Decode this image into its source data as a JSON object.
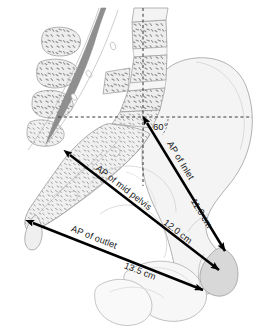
{
  "figure": {
    "type": "anatomical-diagram",
    "view": "midsagittal section",
    "background_color": "#ffffff"
  },
  "palette": {
    "bone_fill": "#f2f2f2",
    "bone_fill_light": "#f7f7f7",
    "bone_outline": "#9a9a9a",
    "trabecular_fill": "#e6e6e6",
    "stipple": "#8e8e8e",
    "spinal_canal": "#8c8c8c",
    "symphysis_fill": "#d6d6d6",
    "arrow_color": "#000000",
    "guide_color": "#3d3d3d",
    "text_color": "#1a1a1a"
  },
  "measurements": [
    {
      "id": "ap-inlet",
      "name_label": "AP of Inlet",
      "value_label": "11.0 cm",
      "value": 11.0,
      "unit": "cm",
      "from": "sacral promontory",
      "to": "superior border of pubic symphysis",
      "start": {
        "x": 145,
        "y": 121
      },
      "end": {
        "x": 227,
        "y": 253
      },
      "name_label_offset": 0.4,
      "value_label_offset": 0.78
    },
    {
      "id": "ap-mid-pelvis",
      "name_label": "AP of mid pelvis",
      "value_label": "12.0 cm",
      "value": 12.0,
      "unit": "cm",
      "from": "mid sacrum",
      "to": "inferior border of pubic symphysis",
      "start": {
        "x": 68,
        "y": 153
      },
      "end": {
        "x": 221,
        "y": 272
      },
      "name_label_offset": 0.37,
      "value_label_offset": 0.73
    },
    {
      "id": "ap-outlet",
      "name_label": "AP of outlet",
      "value_label": "13.5 cm",
      "value": 13.5,
      "unit": "cm",
      "from": "tip of coccyx",
      "to": "lower margin of pubic symphysis",
      "start": {
        "x": 31,
        "y": 222
      },
      "end": {
        "x": 205,
        "y": 291
      },
      "name_label_offset": 0.33,
      "value_label_offset": 0.67
    }
  ],
  "angle": {
    "id": "inlet-angle",
    "label": "60°",
    "value": 60,
    "unit": "degrees",
    "description": "angle of pelvic inlet to the horizontal",
    "vertex": {
      "x": 145,
      "y": 121
    }
  },
  "guides": [
    {
      "id": "horizontal-guide",
      "orientation": "horizontal",
      "description": "horizontal reference plane through sacral promontory",
      "x1": 58,
      "y1": 117,
      "x2": 252,
      "y2": 117
    },
    {
      "id": "vertical-guide",
      "orientation": "vertical",
      "description": "vertical reference axis",
      "x1": 143,
      "y1": 8,
      "x2": 143,
      "y2": 186
    }
  ],
  "structures": [
    {
      "id": "lumbar-vertebrae",
      "label": "lumbar vertebral bodies",
      "region": "upper"
    },
    {
      "id": "spinous-processes",
      "label": "spinous processes",
      "region": "upper-left"
    },
    {
      "id": "vertebral-canal",
      "label": "vertebral canal",
      "region": "upper-centre"
    },
    {
      "id": "sacrum",
      "label": "sacrum",
      "region": "left"
    },
    {
      "id": "coccyx",
      "label": "coccyx",
      "region": "lower-left"
    },
    {
      "id": "ilium",
      "label": "ilium",
      "region": "right"
    },
    {
      "id": "pubic-symphysis",
      "label": "pubic symphysis",
      "region": "lower-right"
    },
    {
      "id": "ischium-pubis",
      "label": "ischium and pubic rami",
      "region": "bottom"
    }
  ]
}
